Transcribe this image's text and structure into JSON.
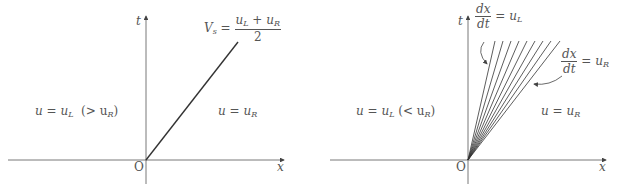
{
  "diagrams": [
    {
      "name": "shock-wave",
      "axis_x_label": "x",
      "axis_t_label": "t",
      "origin_label": "O",
      "left_state_label": "u = u",
      "left_state_sub": "L",
      "left_state_cond": "(> u",
      "left_state_cond_sub": "R",
      "left_state_cond_end": ")",
      "right_state_label": "u = u",
      "right_state_sub": "R",
      "shock_speed": {
        "lhs": "V",
        "lhs_sub": "s",
        "eq": "=",
        "numerator": "u",
        "num_sub1": "L",
        "num_plus": " + u",
        "num_sub2": "R",
        "denominator": "2"
      }
    },
    {
      "name": "rarefaction-fan",
      "axis_x_label": "x",
      "axis_t_label": "t",
      "origin_label": "O",
      "left_state_label": "u = u",
      "left_state_sub": "L",
      "left_state_cond": "(< u",
      "left_state_cond_sub": "R",
      "left_state_cond_end": ")",
      "right_state_label": "u = u",
      "right_state_sub": "R",
      "char_left": {
        "num": "dx",
        "den": "dt",
        "rhs": "= u",
        "sub": "L"
      },
      "char_right": {
        "num": "dx",
        "den": "dt",
        "rhs": "= u",
        "sub": "R"
      },
      "fan_line_count": 9
    }
  ]
}
